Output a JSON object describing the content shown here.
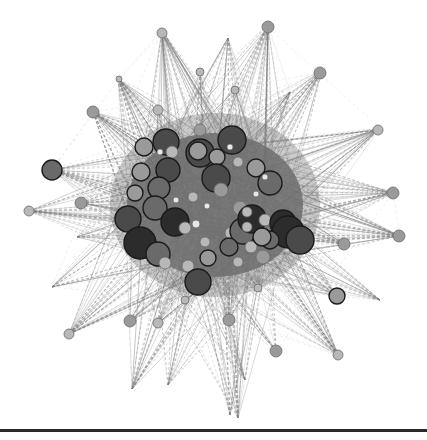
{
  "diagram": {
    "type": "network-graph",
    "style": "grayscale",
    "background": "#ffffff",
    "edge_color": "#7a7a7a",
    "core_fill": "#6e6e6e",
    "colors": {
      "dark": "#2c2c2c",
      "mid_dark": "#4a4a4a",
      "mid": "#6a6a6a",
      "light": "#9a9a9a",
      "pale": "#b8b8b8",
      "white": "#e8e8e8"
    },
    "outer_nodes": [
      {
        "x": 162,
        "y": 33,
        "r": 5,
        "tone": "pale"
      },
      {
        "x": 268,
        "y": 27,
        "r": 6,
        "tone": "light"
      },
      {
        "x": 119,
        "y": 79,
        "r": 3,
        "tone": "pale"
      },
      {
        "x": 320,
        "y": 73,
        "r": 6,
        "tone": "light"
      },
      {
        "x": 93,
        "y": 112,
        "r": 6,
        "tone": "light"
      },
      {
        "x": 378,
        "y": 130,
        "r": 5,
        "tone": "pale"
      },
      {
        "x": 52,
        "y": 170,
        "r": 10,
        "tone": "mid"
      },
      {
        "x": 393,
        "y": 193,
        "r": 6,
        "tone": "light"
      },
      {
        "x": 81,
        "y": 203,
        "r": 6,
        "tone": "light"
      },
      {
        "x": 29,
        "y": 211,
        "r": 5,
        "tone": "pale"
      },
      {
        "x": 399,
        "y": 236,
        "r": 6,
        "tone": "light"
      },
      {
        "x": 344,
        "y": 244,
        "r": 6,
        "tone": "light"
      },
      {
        "x": 337,
        "y": 296,
        "r": 8,
        "tone": "light"
      },
      {
        "x": 69,
        "y": 334,
        "r": 5,
        "tone": "pale"
      },
      {
        "x": 130,
        "y": 321,
        "r": 6,
        "tone": "light"
      },
      {
        "x": 276,
        "y": 351,
        "r": 6,
        "tone": "light"
      },
      {
        "x": 338,
        "y": 355,
        "r": 5,
        "tone": "pale"
      },
      {
        "x": 158,
        "y": 110,
        "r": 5,
        "tone": "pale"
      },
      {
        "x": 200,
        "y": 130,
        "r": 6,
        "tone": "light"
      },
      {
        "x": 235,
        "y": 90,
        "r": 4,
        "tone": "pale"
      },
      {
        "x": 200,
        "y": 72,
        "r": 4,
        "tone": "pale"
      },
      {
        "x": 165,
        "y": 140,
        "r": 4,
        "tone": "pale"
      },
      {
        "x": 229,
        "y": 320,
        "r": 6,
        "tone": "light"
      },
      {
        "x": 158,
        "y": 323,
        "r": 5,
        "tone": "pale"
      },
      {
        "x": 185,
        "y": 300,
        "r": 4,
        "tone": "pale"
      },
      {
        "x": 258,
        "y": 288,
        "r": 4,
        "tone": "pale"
      }
    ],
    "spike_tips": [
      {
        "x": 118,
        "y": 79
      },
      {
        "x": 228,
        "y": 38
      },
      {
        "x": 162,
        "y": 30
      },
      {
        "x": 268,
        "y": 24
      },
      {
        "x": 322,
        "y": 70
      },
      {
        "x": 380,
        "y": 128
      },
      {
        "x": 395,
        "y": 192
      },
      {
        "x": 400,
        "y": 236
      },
      {
        "x": 380,
        "y": 300
      },
      {
        "x": 339,
        "y": 356
      },
      {
        "x": 238,
        "y": 418
      },
      {
        "x": 132,
        "y": 389
      },
      {
        "x": 69,
        "y": 334
      },
      {
        "x": 52,
        "y": 287
      },
      {
        "x": 29,
        "y": 211
      },
      {
        "x": 52,
        "y": 170
      },
      {
        "x": 93,
        "y": 112
      },
      {
        "x": 230,
        "y": 415
      },
      {
        "x": 168,
        "y": 385
      },
      {
        "x": 77,
        "y": 237
      },
      {
        "x": 245,
        "y": 380
      },
      {
        "x": 290,
        "y": 92
      }
    ],
    "core_nodes": [
      {
        "x": 144,
        "y": 147,
        "r": 9,
        "tone": "light"
      },
      {
        "x": 166,
        "y": 142,
        "r": 13,
        "tone": "mid_dark"
      },
      {
        "x": 172,
        "y": 152,
        "r": 6,
        "tone": "pale"
      },
      {
        "x": 200,
        "y": 153,
        "r": 14,
        "tone": "mid_dark"
      },
      {
        "x": 198,
        "y": 151,
        "r": 9,
        "tone": "light"
      },
      {
        "x": 232,
        "y": 140,
        "r": 14,
        "tone": "mid_dark"
      },
      {
        "x": 230,
        "y": 147,
        "r": 3,
        "tone": "white"
      },
      {
        "x": 141,
        "y": 172,
        "r": 9,
        "tone": "light"
      },
      {
        "x": 168,
        "y": 170,
        "r": 12,
        "tone": "mid_dark"
      },
      {
        "x": 159,
        "y": 188,
        "r": 11,
        "tone": "mid"
      },
      {
        "x": 135,
        "y": 193,
        "r": 8,
        "tone": "light"
      },
      {
        "x": 217,
        "y": 157,
        "r": 8,
        "tone": "light"
      },
      {
        "x": 216,
        "y": 178,
        "r": 14,
        "tone": "mid_dark"
      },
      {
        "x": 238,
        "y": 162,
        "r": 5,
        "tone": "pale"
      },
      {
        "x": 221,
        "y": 190,
        "r": 7,
        "tone": "light"
      },
      {
        "x": 155,
        "y": 208,
        "r": 12,
        "tone": "mid"
      },
      {
        "x": 128,
        "y": 219,
        "r": 13,
        "tone": "mid_dark"
      },
      {
        "x": 175,
        "y": 222,
        "r": 14,
        "tone": "dark"
      },
      {
        "x": 193,
        "y": 197,
        "r": 5,
        "tone": "pale"
      },
      {
        "x": 185,
        "y": 228,
        "r": 6,
        "tone": "pale"
      },
      {
        "x": 196,
        "y": 224,
        "r": 4,
        "tone": "white"
      },
      {
        "x": 240,
        "y": 208,
        "r": 7,
        "tone": "light"
      },
      {
        "x": 256,
        "y": 168,
        "r": 9,
        "tone": "light"
      },
      {
        "x": 270,
        "y": 183,
        "r": 12,
        "tone": "mid"
      },
      {
        "x": 265,
        "y": 177,
        "r": 3,
        "tone": "white"
      },
      {
        "x": 231,
        "y": 233,
        "r": 6,
        "tone": "pale"
      },
      {
        "x": 205,
        "y": 242,
        "r": 5,
        "tone": "pale"
      },
      {
        "x": 243,
        "y": 231,
        "r": 13,
        "tone": "mid"
      },
      {
        "x": 252,
        "y": 219,
        "r": 14,
        "tone": "dark"
      },
      {
        "x": 247,
        "y": 212,
        "r": 5,
        "tone": "pale"
      },
      {
        "x": 247,
        "y": 227,
        "r": 5,
        "tone": "pale"
      },
      {
        "x": 265,
        "y": 220,
        "r": 6,
        "tone": "pale"
      },
      {
        "x": 283,
        "y": 223,
        "r": 13,
        "tone": "dark"
      },
      {
        "x": 281,
        "y": 230,
        "r": 7,
        "tone": "light"
      },
      {
        "x": 288,
        "y": 232,
        "r": 16,
        "tone": "dark"
      },
      {
        "x": 275,
        "y": 240,
        "r": 4,
        "tone": "white"
      },
      {
        "x": 300,
        "y": 240,
        "r": 14,
        "tone": "mid_dark"
      },
      {
        "x": 229,
        "y": 247,
        "r": 9,
        "tone": "mid"
      },
      {
        "x": 208,
        "y": 258,
        "r": 8,
        "tone": "light"
      },
      {
        "x": 263,
        "y": 257,
        "r": 7,
        "tone": "light"
      },
      {
        "x": 270,
        "y": 240,
        "r": 9,
        "tone": "mid"
      },
      {
        "x": 140,
        "y": 243,
        "r": 16,
        "tone": "dark"
      },
      {
        "x": 158,
        "y": 254,
        "r": 12,
        "tone": "mid"
      },
      {
        "x": 165,
        "y": 263,
        "r": 6,
        "tone": "pale"
      },
      {
        "x": 188,
        "y": 266,
        "r": 6,
        "tone": "pale"
      },
      {
        "x": 198,
        "y": 282,
        "r": 13,
        "tone": "mid_dark"
      },
      {
        "x": 238,
        "y": 262,
        "r": 5,
        "tone": "pale"
      },
      {
        "x": 251,
        "y": 247,
        "r": 6,
        "tone": "pale"
      },
      {
        "x": 262,
        "y": 237,
        "r": 9,
        "tone": "light"
      },
      {
        "x": 176,
        "y": 200,
        "r": 3,
        "tone": "white"
      },
      {
        "x": 207,
        "y": 206,
        "r": 3,
        "tone": "white"
      },
      {
        "x": 160,
        "y": 152,
        "r": 3,
        "tone": "white"
      },
      {
        "x": 256,
        "y": 194,
        "r": 3,
        "tone": "white"
      }
    ],
    "bottom_rule": {
      "y": 430,
      "thickness": 3,
      "color": "#2a2a2a"
    }
  }
}
